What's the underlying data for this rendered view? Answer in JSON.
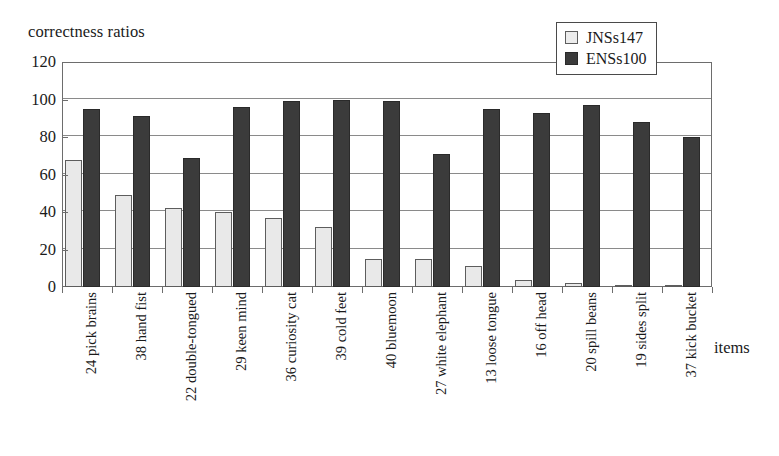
{
  "chart_data": {
    "type": "bar",
    "title": "",
    "ylabel": "correctness ratios",
    "xlabel": "items",
    "ylim": [
      0,
      120
    ],
    "yticks": [
      0,
      20,
      40,
      60,
      80,
      100,
      120
    ],
    "grid": true,
    "legend_position": "top-right",
    "categories": [
      "24 pick brains",
      "38 hand fist",
      "22 double-tongued",
      "29 keen mind",
      "36 curiosity cat",
      "39 cold feet",
      "40 bluemoon",
      "27 white elephant",
      "13 loose tongue",
      "16 off head",
      "20 spill beans",
      "19 sides split",
      "37 kick bucket"
    ],
    "series": [
      {
        "name": "JNSs147",
        "color": "#e9e9e9",
        "values": [
          68,
          49,
          42,
          40,
          37,
          32,
          15,
          15,
          11,
          4,
          2,
          1,
          0
        ]
      },
      {
        "name": "ENSs100",
        "color": "#3b3b3b",
        "values": [
          95,
          91,
          69,
          96,
          99,
          100,
          99,
          71,
          95,
          93,
          97,
          88,
          80
        ]
      }
    ]
  },
  "axes": {
    "y_title": "correctness ratios",
    "x_title": "items",
    "y_tick_labels": [
      "120",
      "100",
      "80",
      "60",
      "40",
      "20",
      "0"
    ]
  },
  "legend": {
    "items": [
      {
        "label": "JNSs147",
        "swatch": "light-square-swatch"
      },
      {
        "label": "ENSs100",
        "swatch": "dark-square-swatch"
      }
    ]
  }
}
